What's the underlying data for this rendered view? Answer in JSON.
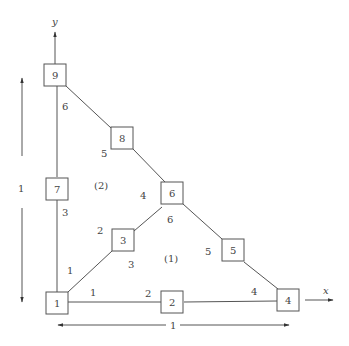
{
  "diagram": {
    "axes": {
      "x_label": "x",
      "y_label": "y"
    },
    "dimensions": {
      "horizontal": "1",
      "vertical": "1"
    },
    "nodes": [
      {
        "id": "1",
        "label": "1"
      },
      {
        "id": "2",
        "label": "2"
      },
      {
        "id": "3",
        "label": "3"
      },
      {
        "id": "4",
        "label": "4"
      },
      {
        "id": "5",
        "label": "5"
      },
      {
        "id": "6",
        "label": "6"
      },
      {
        "id": "7",
        "label": "7"
      },
      {
        "id": "8",
        "label": "8"
      },
      {
        "id": "9",
        "label": "9"
      }
    ],
    "elements": [
      {
        "label": "(1)",
        "local_node_labels": [
          "1",
          "2",
          "3",
          "4",
          "5",
          "6"
        ]
      },
      {
        "label": "(2)",
        "local_node_labels": [
          "1",
          "2",
          "3",
          "4",
          "5",
          "6"
        ]
      }
    ]
  }
}
